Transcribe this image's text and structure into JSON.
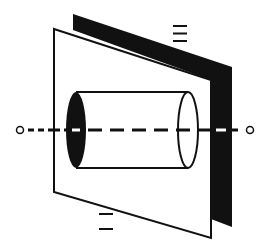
{
  "diagram": {
    "colors": {
      "background": "#ffffff",
      "ink": "#111111",
      "back_plate_fill": "#111111",
      "front_plate_fill": "#ffffff",
      "cylinder_near_end_fill": "#111111"
    },
    "labels": {
      "back_plate_symbol": "≡",
      "front_plate_symbol": "="
    },
    "elements": [
      {
        "name": "back-plate",
        "description": "dark parallel plate behind"
      },
      {
        "name": "front-plate",
        "description": "white parallel plate in front"
      },
      {
        "name": "cylinder",
        "description": "cylinder passing through front plate along the axis"
      },
      {
        "name": "axis-line",
        "description": "dashed rotation axis with open circle endpoints"
      }
    ]
  }
}
